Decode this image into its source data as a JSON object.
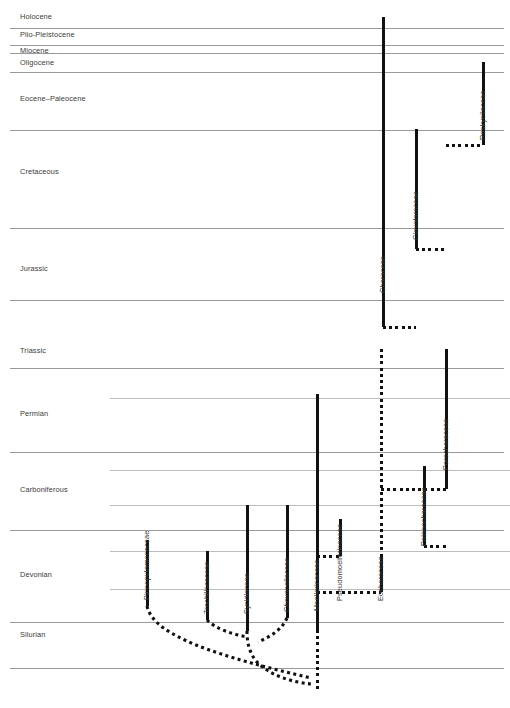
{
  "figure": {
    "kind": "stratigraphic-range-chart",
    "background": "#ffffff",
    "line_color": "#111111",
    "grid_color": "#9a9a9a",
    "text_color": "#3b3b3b",
    "width": 510,
    "height": 708
  },
  "chart_data": {
    "type": "table",
    "title": "",
    "xlabel": "",
    "ylabel": "Geological time",
    "grid": true,
    "legend": null,
    "axis_orientation": "time-vertical-oldest-at-bottom",
    "time_units": [
      {
        "name": "Holocene",
        "top_y": 10,
        "bottom_y": 28,
        "label_y": 18
      },
      {
        "name": "Plio-Pleistocene",
        "top_y": 28,
        "bottom_y": 45,
        "label_y": 36
      },
      {
        "name": "Miocene",
        "top_y": 45,
        "bottom_y": 53,
        "label_y": 52
      },
      {
        "name": "Oligocene",
        "top_y": 53,
        "bottom_y": 72,
        "label_y": 64
      },
      {
        "name": "Eocene–Paleocene",
        "top_y": 72,
        "bottom_y": 130,
        "label_y": 100
      },
      {
        "name": "Cretaceous",
        "top_y": 130,
        "bottom_y": 228,
        "label_y": 173
      },
      {
        "name": "Jurassic",
        "top_y": 228,
        "bottom_y": 300,
        "label_y": 270
      },
      {
        "name": "Triassic",
        "top_y": 300,
        "bottom_y": 368,
        "label_y": 352
      },
      {
        "name": "Permian",
        "top_y": 368,
        "bottom_y": 452,
        "label_y": 415
      },
      {
        "name": "Carboniferous",
        "top_y": 452,
        "bottom_y": 530,
        "label_y": 491
      },
      {
        "name": "Devonian",
        "top_y": 530,
        "bottom_y": 622,
        "label_y": 576
      },
      {
        "name": "Silurian",
        "top_y": 622,
        "bottom_y": 668,
        "label_y": 636
      }
    ],
    "gridlines_major_y": [
      28,
      45,
      53,
      72,
      130,
      228,
      300,
      368,
      452,
      530,
      622,
      668
    ],
    "gridlines_minor": [
      {
        "y": 398,
        "x_start": 110,
        "x_end": 510
      },
      {
        "y": 470,
        "x_start": 110,
        "x_end": 510
      },
      {
        "y": 505,
        "x_start": 110,
        "x_end": 510
      },
      {
        "y": 551,
        "x_start": 110,
        "x_end": 510
      },
      {
        "y": 589,
        "x_start": 110,
        "x_end": 510
      }
    ],
    "taxa": [
      {
        "name": "Pinnoputamenaceae",
        "x": 147,
        "solid_top_y": 540,
        "solid_bottom_y": 606,
        "label_y_bottom": 600
      },
      {
        "name": "Trochiliscaceae",
        "x": 207,
        "solid_top_y": 551,
        "solid_bottom_y": 620,
        "label_y_bottom": 614
      },
      {
        "name": "Sycidiaceae",
        "x": 247,
        "solid_top_y": 505,
        "solid_bottom_y": 631,
        "label_y_bottom": 614
      },
      {
        "name": "Chovanellaceae",
        "x": 287,
        "solid_top_y": 505,
        "solid_bottom_y": 618,
        "label_y_bottom": 612
      },
      {
        "name": "Moellerinaceae",
        "x": 317,
        "solid_top_y": 394,
        "solid_bottom_y": 630,
        "label_y_bottom": 611
      },
      {
        "name": "Pseudomoellerinaceae",
        "x": 340,
        "solid_top_y": 519,
        "solid_bottom_y": 556,
        "label_y_bottom": 601
      },
      {
        "name": "Eocharaceae",
        "x": 381,
        "solid_top_y": 555,
        "solid_bottom_y": 592,
        "label_y_bottom": 601
      },
      {
        "name": "Palaeocharaceae",
        "x": 424,
        "solid_top_y": 466,
        "solid_bottom_y": 546,
        "label_y_bottom": 546
      },
      {
        "name": "Porocharaceae",
        "x": 446,
        "solid_top_y": 349,
        "solid_bottom_y": 489,
        "label_y_bottom": 470
      },
      {
        "name": "Characeae",
        "x": 383,
        "solid_top_y": 17,
        "solid_bottom_y": 327,
        "label_y_bottom": 293
      },
      {
        "name": "Clavatoraceae",
        "x": 416,
        "solid_top_y": 129,
        "solid_bottom_y": 249,
        "label_y_bottom": 240
      },
      {
        "name": "Raskyellaceae",
        "x": 483,
        "solid_top_y": 62,
        "solid_bottom_y": 145,
        "label_y_bottom": 140
      }
    ],
    "ghost_lineages_horizontal": [
      {
        "from_taxon": "Characeae",
        "y": 327,
        "x_start": 383,
        "x_end": 416
      },
      {
        "from_taxon": "Clavatoraceae",
        "y": 249,
        "x_start": 416,
        "x_end": 446
      },
      {
        "from_taxon": "Porocharaceae",
        "y": 145,
        "x_start": 446,
        "x_end": 483
      },
      {
        "from_taxon": "Porocharaceae",
        "y": 489,
        "x_start": 381,
        "x_end": 446
      },
      {
        "from_taxon": "Palaeocharaceae",
        "y": 546,
        "x_start": 424,
        "x_end": 446
      },
      {
        "from_taxon": "Pseudomoellerinaceae",
        "y": 556,
        "x_start": 317,
        "x_end": 340
      },
      {
        "from_taxon": "Eocharaceae",
        "y": 592,
        "x_start": 317,
        "x_end": 381
      }
    ],
    "ghost_lineages_vertical": [
      {
        "taxon": "Eocharaceae",
        "x": 381,
        "y_start": 349,
        "y_end": 592
      },
      {
        "taxon": "Moellerinaceae",
        "x": 317,
        "y_start": 630,
        "y_end": 690
      }
    ],
    "branch_curves": [
      {
        "from": "Pinnoputamenaceae",
        "path": "M147,606 C151,623 170,634 196,645 C226,657 268,668 311,678"
      },
      {
        "from": "Trochiliscaceae",
        "path": "M207,620 C216,629 232,634 247,637"
      },
      {
        "from": "Sycidiaceae",
        "path": "M247,631 C247,642 249,652 256,661 C270,676 292,682 311,684"
      },
      {
        "from": "Chovanellaceae",
        "path": "M287,618 C282,629 272,636 258,642"
      }
    ]
  }
}
